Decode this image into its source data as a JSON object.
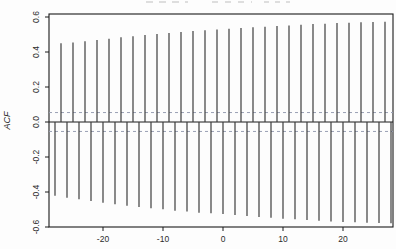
{
  "chart_data": {
    "type": "bar",
    "subtype": "acf-spike-plot",
    "title": "",
    "xlabel": "",
    "ylabel": "ACF",
    "xlim": [
      -29,
      28.4
    ],
    "ylim": [
      -0.6,
      0.62
    ],
    "x_ticks": [
      -20,
      -10,
      0,
      10,
      20
    ],
    "y_ticks": [
      0.6,
      0.4,
      0.2,
      0.0,
      -0.2,
      -0.4,
      -0.6
    ],
    "grid": false,
    "legend": "none",
    "zero_line": 0.0,
    "confidence_band": 0.054,
    "confidence_band_values": [
      0.054,
      -0.054
    ],
    "spike_color": "#3d3d3d",
    "box_color": "#1a1a1a",
    "confidence_color": "#9aa0b4",
    "background_color": "#fdfdfd",
    "lags": [
      -28,
      -27,
      -26,
      -25,
      -24,
      -23,
      -22,
      -21,
      -20,
      -19,
      -18,
      -17,
      -16,
      -15,
      -14,
      -13,
      -12,
      -11,
      -10,
      -9,
      -8,
      -7,
      -6,
      -5,
      -4,
      -3,
      -2,
      -1,
      0,
      1,
      2,
      3,
      4,
      5,
      6,
      7,
      8,
      9,
      10,
      11,
      12,
      13,
      14,
      15,
      16,
      17,
      18,
      19,
      20,
      21,
      22,
      23,
      24,
      25,
      26,
      27,
      28
    ],
    "values": [
      -0.421,
      0.45,
      -0.433,
      0.455,
      -0.442,
      0.461,
      -0.451,
      0.469,
      -0.461,
      0.476,
      -0.47,
      0.484,
      -0.478,
      0.49,
      -0.486,
      0.497,
      -0.493,
      0.503,
      -0.499,
      0.509,
      -0.507,
      0.514,
      -0.512,
      0.52,
      -0.518,
      0.524,
      -0.522,
      0.529,
      -0.526,
      0.533,
      -0.531,
      0.537,
      -0.537,
      0.541,
      -0.543,
      0.545,
      -0.547,
      0.549,
      -0.553,
      0.552,
      -0.556,
      0.556,
      -0.56,
      0.56,
      -0.564,
      0.562,
      -0.568,
      0.566,
      -0.571,
      0.567,
      -0.573,
      0.57,
      -0.575,
      0.571,
      -0.577,
      0.573,
      -0.579
    ]
  }
}
